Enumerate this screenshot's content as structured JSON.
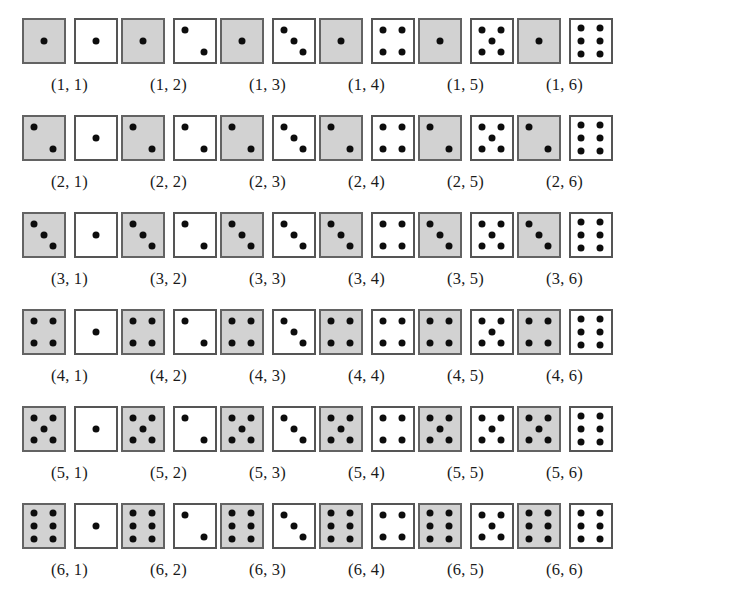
{
  "figure": {
    "name": "two-dice-sample-space",
    "grid_rows": 6,
    "grid_cols": 6,
    "total_outcomes": 36,
    "die_colors": {
      "first_die_fill": "#d2d2d2",
      "second_die_fill": "#ffffff",
      "die_border": "#555555",
      "pip_color": "#0d0d0d",
      "background": "#ffffff"
    },
    "pip_layouts": {
      "1": [
        [
          50,
          50
        ]
      ],
      "2": [
        [
          27,
          24
        ],
        [
          73,
          76
        ]
      ],
      "3": [
        [
          27,
          24
        ],
        [
          50,
          50
        ],
        [
          73,
          76
        ]
      ],
      "4": [
        [
          27,
          24
        ],
        [
          73,
          24
        ],
        [
          27,
          76
        ],
        [
          73,
          76
        ]
      ],
      "5": [
        [
          27,
          24
        ],
        [
          73,
          24
        ],
        [
          50,
          50
        ],
        [
          27,
          76
        ],
        [
          73,
          76
        ]
      ],
      "6": [
        [
          27,
          20
        ],
        [
          73,
          20
        ],
        [
          27,
          50
        ],
        [
          73,
          50
        ],
        [
          27,
          80
        ],
        [
          73,
          80
        ]
      ]
    }
  },
  "rows": [
    {
      "index": 1,
      "cells": [
        {
          "label": "(1, 1)",
          "first": 1,
          "second": 1
        },
        {
          "label": "(1, 2)",
          "first": 1,
          "second": 2
        },
        {
          "label": "(1, 3)",
          "first": 1,
          "second": 3
        },
        {
          "label": "(1, 4)",
          "first": 1,
          "second": 4
        },
        {
          "label": "(1, 5)",
          "first": 1,
          "second": 5
        },
        {
          "label": "(1, 6)",
          "first": 1,
          "second": 6
        }
      ]
    },
    {
      "index": 2,
      "cells": [
        {
          "label": "(2, 1)",
          "first": 2,
          "second": 1
        },
        {
          "label": "(2, 2)",
          "first": 2,
          "second": 2
        },
        {
          "label": "(2, 3)",
          "first": 2,
          "second": 3
        },
        {
          "label": "(2, 4)",
          "first": 2,
          "second": 4
        },
        {
          "label": "(2, 5)",
          "first": 2,
          "second": 5
        },
        {
          "label": "(2, 6)",
          "first": 2,
          "second": 6
        }
      ]
    },
    {
      "index": 3,
      "cells": [
        {
          "label": "(3, 1)",
          "first": 3,
          "second": 1
        },
        {
          "label": "(3, 2)",
          "first": 3,
          "second": 2
        },
        {
          "label": "(3, 3)",
          "first": 3,
          "second": 3
        },
        {
          "label": "(3, 4)",
          "first": 3,
          "second": 4
        },
        {
          "label": "(3, 5)",
          "first": 3,
          "second": 5
        },
        {
          "label": "(3, 6)",
          "first": 3,
          "second": 6
        }
      ]
    },
    {
      "index": 4,
      "cells": [
        {
          "label": "(4, 1)",
          "first": 4,
          "second": 1
        },
        {
          "label": "(4, 2)",
          "first": 4,
          "second": 2
        },
        {
          "label": "(4, 3)",
          "first": 4,
          "second": 3
        },
        {
          "label": "(4, 4)",
          "first": 4,
          "second": 4
        },
        {
          "label": "(4, 5)",
          "first": 4,
          "second": 5
        },
        {
          "label": "(4, 6)",
          "first": 4,
          "second": 6
        }
      ]
    },
    {
      "index": 5,
      "cells": [
        {
          "label": "(5, 1)",
          "first": 5,
          "second": 1
        },
        {
          "label": "(5, 2)",
          "first": 5,
          "second": 2
        },
        {
          "label": "(5, 3)",
          "first": 5,
          "second": 3
        },
        {
          "label": "(5, 4)",
          "first": 5,
          "second": 4
        },
        {
          "label": "(5, 5)",
          "first": 5,
          "second": 5
        },
        {
          "label": "(5, 6)",
          "first": 5,
          "second": 6
        }
      ]
    },
    {
      "index": 6,
      "cells": [
        {
          "label": "(6, 1)",
          "first": 6,
          "second": 1
        },
        {
          "label": "(6, 2)",
          "first": 6,
          "second": 2
        },
        {
          "label": "(6, 3)",
          "first": 6,
          "second": 3
        },
        {
          "label": "(6, 4)",
          "first": 6,
          "second": 4
        },
        {
          "label": "(6, 5)",
          "first": 6,
          "second": 5
        },
        {
          "label": "(6, 6)",
          "first": 6,
          "second": 6
        }
      ]
    }
  ]
}
